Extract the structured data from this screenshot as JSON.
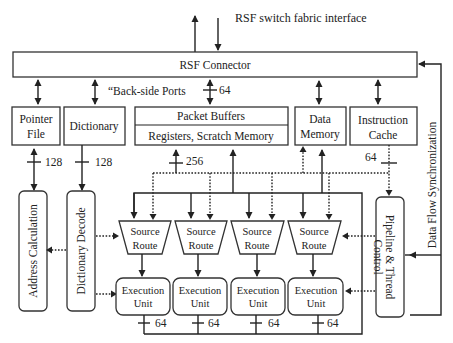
{
  "title": "RSF switch fabric interface",
  "blocks": {
    "rsf_connector": "RSF Connector",
    "back_side_ports": "“Back-side Ports",
    "pointer_file_line1": "Pointer",
    "pointer_file_line2": "File",
    "dictionary": "Dictionary",
    "packet_buffers": "Packet Buffers",
    "registers": "Registers, Scratch Memory",
    "data_memory_line1": "Data",
    "data_memory_line2": "Memory",
    "instruction_cache_line1": "Instruction",
    "instruction_cache_line2": "Cache",
    "address_calculation": "Address Calculation",
    "dictionary_decode": "Dictionary Decode",
    "pipeline_control_line1": "Pipeline & Thread",
    "pipeline_control_line2": "Control",
    "data_flow_sync": "Data Flow Synchronization"
  },
  "source_routes": [
    {
      "line1": "Source",
      "line2": "Route"
    },
    {
      "line1": "Source",
      "line2": "Route"
    },
    {
      "line1": "Source",
      "line2": "Route"
    },
    {
      "line1": "Source",
      "line2": "Route"
    }
  ],
  "execution_units": [
    {
      "line1": "Execution",
      "line2": "Unit"
    },
    {
      "line1": "Execution",
      "line2": "Unit"
    },
    {
      "line1": "Execution",
      "line2": "Unit"
    },
    {
      "line1": "Execution",
      "line2": "Unit"
    }
  ],
  "bus_widths": {
    "back_side": "64",
    "pointer_file": "128",
    "dictionary": "128",
    "registers": "256",
    "instruction_cache": "64",
    "eu": [
      "64",
      "64",
      "64",
      "64"
    ]
  }
}
